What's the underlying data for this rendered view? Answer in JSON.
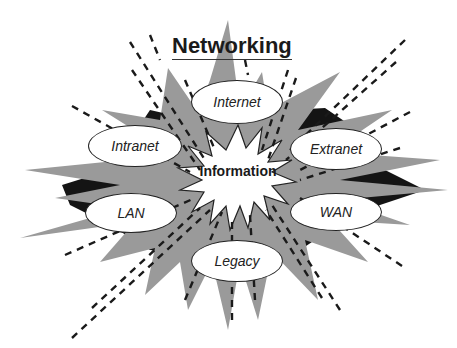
{
  "diagram": {
    "title": "Networking",
    "center": {
      "label": "Information",
      "shape": "white-starburst"
    },
    "nodes": [
      {
        "id": "internet",
        "label": "Internet"
      },
      {
        "id": "intranet",
        "label": "Intranet"
      },
      {
        "id": "extranet",
        "label": "Extranet"
      },
      {
        "id": "lan",
        "label": "LAN"
      },
      {
        "id": "wan",
        "label": "WAN"
      },
      {
        "id": "legacy",
        "label": "Legacy"
      }
    ],
    "colors": {
      "burst_gray": "#9a9a9a",
      "burst_shadow": "#141414",
      "dash": "#1a1a1a",
      "node_fill": "#ffffff",
      "background": "#ffffff"
    }
  }
}
